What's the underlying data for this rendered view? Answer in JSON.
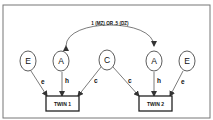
{
  "diagram": {
    "correlation_label": "1 (MZ) OR .5 (DZ)",
    "nodes": {
      "e1": "E",
      "a1": "A",
      "c": "C",
      "a2": "A",
      "e2": "E"
    },
    "boxes": {
      "twin1": "TWIN 1",
      "twin2": "TWIN 2"
    },
    "edge_labels": {
      "e1_twin1": "e",
      "a1_twin1": "h",
      "c_twin1": "c",
      "c_twin2": "c",
      "a2_twin2": "h",
      "e2_twin2": "e"
    }
  }
}
